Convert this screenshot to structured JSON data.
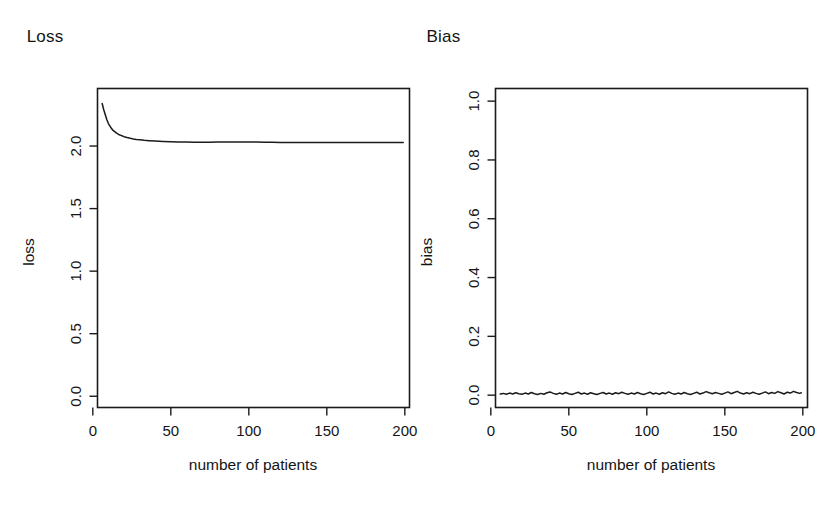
{
  "figure": {
    "background": "#ffffff",
    "ink_color": "#1b1b1b",
    "panel_count": 2
  },
  "panels": [
    {
      "id": "loss",
      "title": "Loss",
      "xlabel": "number of patients",
      "ylabel": "loss",
      "x_ticks": [
        "0",
        "50",
        "100",
        "150",
        "200"
      ],
      "y_ticks": [
        "0.0",
        "0.5",
        "1.0",
        "1.5",
        "2.0"
      ]
    },
    {
      "id": "bias",
      "title": "Bias",
      "xlabel": "number of patients",
      "ylabel": "bias",
      "x_ticks": [
        "0",
        "50",
        "100",
        "150",
        "200"
      ],
      "y_ticks": [
        "0.0",
        "0.2",
        "0.4",
        "0.6",
        "0.8",
        "1.0"
      ]
    }
  ],
  "chart_data": [
    {
      "type": "line",
      "title": "Loss",
      "xlabel": "number of patients",
      "ylabel": "loss",
      "xlim": [
        3,
        203
      ],
      "ylim": [
        -0.09,
        2.46
      ],
      "xticks": [
        0,
        50,
        100,
        150,
        200
      ],
      "yticks": [
        0.0,
        0.5,
        1.0,
        1.5,
        2.0
      ],
      "grid": false,
      "legend": "none",
      "series": [
        {
          "name": "loss",
          "x": [
            6,
            7,
            8,
            9,
            10,
            11,
            12,
            13,
            14,
            15,
            16,
            17,
            18,
            19,
            20,
            22,
            24,
            26,
            28,
            30,
            33,
            36,
            40,
            45,
            50,
            55,
            60,
            65,
            70,
            75,
            80,
            85,
            90,
            95,
            100,
            105,
            110,
            115,
            120,
            125,
            130,
            135,
            140,
            145,
            150,
            155,
            160,
            165,
            170,
            175,
            180,
            185,
            190,
            195,
            199
          ],
          "y": [
            2.34,
            2.29,
            2.25,
            2.21,
            2.18,
            2.16,
            2.14,
            2.125,
            2.115,
            2.105,
            2.097,
            2.09,
            2.085,
            2.08,
            2.075,
            2.068,
            2.062,
            2.057,
            2.053,
            2.05,
            2.046,
            2.043,
            2.04,
            2.037,
            2.035,
            2.033,
            2.032,
            2.031,
            2.031,
            2.031,
            2.032,
            2.032,
            2.033,
            2.033,
            2.033,
            2.032,
            2.031,
            2.03,
            2.029,
            2.028,
            2.028,
            2.028,
            2.028,
            2.028,
            2.028,
            2.028,
            2.028,
            2.028,
            2.028,
            2.028,
            2.028,
            2.028,
            2.028,
            2.028,
            2.028
          ]
        }
      ]
    },
    {
      "type": "line",
      "title": "Bias",
      "xlabel": "number of patients",
      "ylabel": "bias",
      "xlim": [
        3,
        203
      ],
      "ylim": [
        -0.042,
        1.043
      ],
      "xticks": [
        0,
        50,
        100,
        150,
        200
      ],
      "yticks": [
        0.0,
        0.2,
        0.4,
        0.6,
        0.8,
        1.0
      ],
      "grid": false,
      "legend": "none",
      "series": [
        {
          "name": "bias",
          "x": [
            6,
            8,
            10,
            12,
            14,
            16,
            18,
            20,
            22,
            24,
            26,
            28,
            30,
            32,
            34,
            36,
            38,
            40,
            42,
            44,
            46,
            48,
            50,
            52,
            54,
            56,
            58,
            60,
            62,
            64,
            66,
            68,
            70,
            72,
            74,
            76,
            78,
            80,
            82,
            84,
            86,
            88,
            90,
            92,
            94,
            96,
            98,
            100,
            102,
            104,
            106,
            108,
            110,
            112,
            114,
            116,
            118,
            120,
            122,
            124,
            126,
            128,
            130,
            132,
            134,
            136,
            138,
            140,
            142,
            144,
            146,
            148,
            150,
            152,
            154,
            156,
            158,
            160,
            162,
            164,
            166,
            168,
            170,
            172,
            174,
            176,
            178,
            180,
            182,
            184,
            186,
            188,
            190,
            192,
            194,
            196,
            198,
            199
          ],
          "y": [
            0.004,
            0.006,
            0.003,
            0.007,
            0.004,
            0.008,
            0.005,
            0.003,
            0.007,
            0.004,
            0.009,
            0.005,
            0.002,
            0.006,
            0.003,
            0.008,
            0.011,
            0.006,
            0.003,
            0.007,
            0.004,
            0.009,
            0.005,
            0.002,
            0.006,
            0.01,
            0.004,
            0.007,
            0.003,
            0.008,
            0.005,
            0.002,
            0.006,
            0.009,
            0.004,
            0.007,
            0.003,
            0.008,
            0.005,
            0.01,
            0.006,
            0.003,
            0.007,
            0.004,
            0.009,
            0.005,
            0.002,
            0.006,
            0.01,
            0.004,
            0.007,
            0.003,
            0.008,
            0.005,
            0.011,
            0.006,
            0.003,
            0.007,
            0.004,
            0.009,
            0.005,
            0.002,
            0.006,
            0.01,
            0.004,
            0.007,
            0.012,
            0.008,
            0.005,
            0.009,
            0.006,
            0.003,
            0.007,
            0.011,
            0.005,
            0.009,
            0.013,
            0.007,
            0.004,
            0.008,
            0.005,
            0.01,
            0.006,
            0.003,
            0.007,
            0.011,
            0.005,
            0.009,
            0.006,
            0.012,
            0.008,
            0.004,
            0.01,
            0.007,
            0.013,
            0.009,
            0.006,
            0.008
          ]
        }
      ]
    }
  ]
}
